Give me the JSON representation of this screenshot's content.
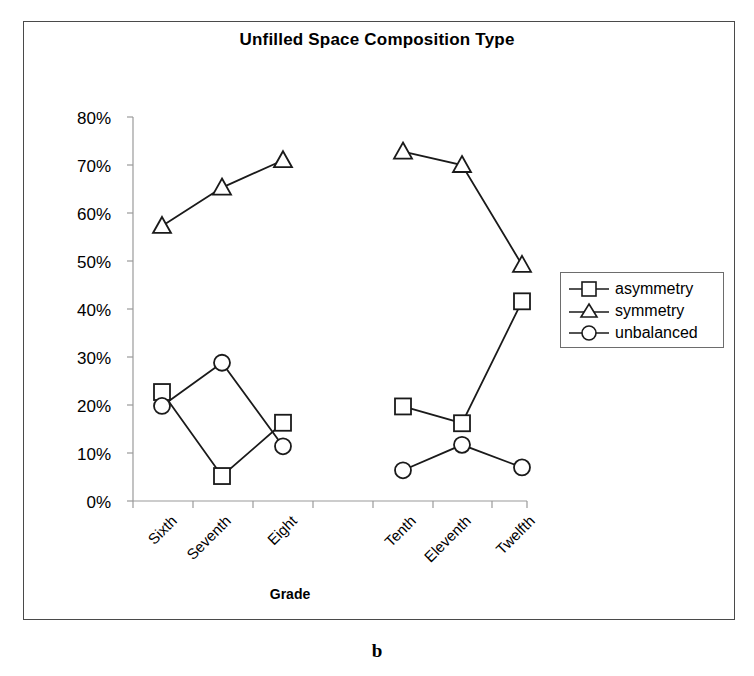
{
  "figure": {
    "caption": "b",
    "title": "Unfilled Space Composition Type",
    "xaxis_title": "Grade"
  },
  "legend": {
    "position": "right-middle",
    "entries": [
      {
        "label": "asymmetry",
        "marker": "square"
      },
      {
        "label": "symmetry",
        "marker": "triangle"
      },
      {
        "label": "unbalanced",
        "marker": "circle"
      }
    ]
  },
  "axes": {
    "y_ticks": [
      "80%",
      "70%",
      "60%",
      "50%",
      "40%",
      "30%",
      "20%",
      "10%",
      "0%"
    ],
    "x_ticks": [
      "Sixth",
      "Seventh",
      "Eight",
      "Tenth",
      "Eleventh",
      "Twelfth"
    ]
  },
  "colors": {
    "line": "#1a1a1a",
    "axis": "#808080",
    "frame": "#4a4a4a",
    "background": "#ffffff"
  },
  "chart_data": {
    "type": "line",
    "title": "Unfilled Space Composition Type",
    "xlabel": "Grade",
    "ylabel": "",
    "ylim": [
      0,
      80
    ],
    "ytick_values": [
      0,
      10,
      20,
      30,
      40,
      50,
      60,
      70,
      80
    ],
    "ytick_format": "percent",
    "grid": false,
    "legend_position": "right",
    "categories": [
      "Sixth",
      "Seventh",
      "Eight",
      "Tenth",
      "Eleventh",
      "Twelfth"
    ],
    "note": "Series are drawn as two separate segments: grades Sixth-Eight and Tenth-Twelfth (Ninth has no data).",
    "series": [
      {
        "name": "asymmetry",
        "marker": "square",
        "values": [
          22.7,
          5.2,
          16.3,
          19.7,
          16.2,
          41.6
        ]
      },
      {
        "name": "symmetry",
        "marker": "triangle",
        "values": [
          57.3,
          65.3,
          71.0,
          72.8,
          70.0,
          49.2
        ]
      },
      {
        "name": "unbalanced",
        "marker": "circle",
        "values": [
          19.8,
          28.8,
          11.4,
          6.4,
          11.7,
          7.0
        ]
      }
    ]
  }
}
